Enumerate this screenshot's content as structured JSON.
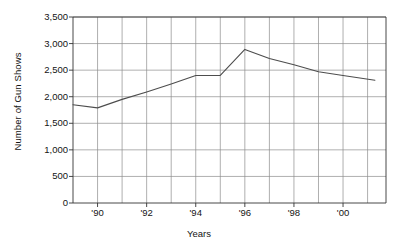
{
  "chart_data": {
    "type": "line",
    "title": "",
    "xlabel": "Years",
    "ylabel": "Number of Gun Shows",
    "xlim": [
      1989.0,
      2001.75
    ],
    "ylim": [
      0,
      3500
    ],
    "grid": true,
    "legend": "none",
    "y_ticks": [
      0,
      500,
      1000,
      1500,
      2000,
      2500,
      3000,
      3500
    ],
    "y_tick_labels": [
      "0",
      "500",
      "1,000",
      "1,500",
      "2,000",
      "2,500",
      "3,000",
      "3,500"
    ],
    "x_ticks": [
      1990,
      1992,
      1994,
      1996,
      1998,
      2000
    ],
    "x_tick_labels": [
      "'90",
      "'92",
      "'94",
      "'96",
      "'98",
      "'00"
    ],
    "x_minor_gridlines": [
      1989.0,
      1990,
      1991,
      1992,
      1993,
      1994,
      1995,
      1996,
      1997,
      1998,
      1999,
      2000,
      2001,
      2001.75
    ],
    "series": [
      {
        "name": "Number of Gun Shows",
        "color": "#4d4d4d",
        "x": [
          1989.0,
          1990,
          1991,
          1992,
          1993,
          1994,
          1995,
          1996,
          1997,
          1998,
          1999,
          2000,
          2001.3
        ],
        "values": [
          1850,
          1790,
          1950,
          2090,
          2240,
          2400,
          2400,
          2890,
          2720,
          2600,
          2470,
          2400,
          2310
        ]
      }
    ]
  }
}
